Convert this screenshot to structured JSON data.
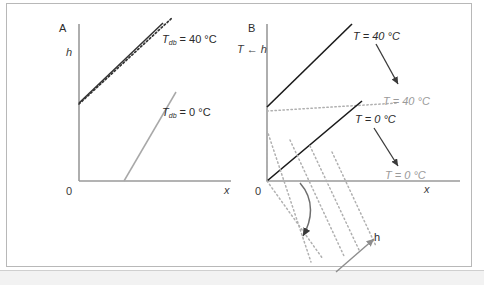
{
  "figure": {
    "background_color": "#ffffff",
    "border_color": "#b8b8b8",
    "bottom_strip_color": "#f2f2f2"
  },
  "colors": {
    "dark_line": "#333333",
    "black_line": "#1a1a1a",
    "gray_line": "#a8a8a8",
    "gray_dotted": "#b0b0b0",
    "axis": "#9a9a9a",
    "text_dark": "#2b2b2b",
    "text_gray": "#9a9a9a"
  },
  "panel_a": {
    "letter": "A",
    "y_axis_label": "h",
    "x_axis_label": "x",
    "origin_label": "0",
    "annotations": [
      {
        "id": "tdb40",
        "symbol": "T",
        "subscript": "db",
        "equals": " = 40 °C",
        "full_text": "T_db = 40 °C",
        "color": "#2b2b2b",
        "style": "dark"
      },
      {
        "id": "tdb0",
        "symbol": "T",
        "subscript": "db",
        "equals": " = 0 °C",
        "full_text": "T_db = 0 °C",
        "color": "#2b2b2b",
        "style": "dark"
      }
    ],
    "curves": [
      {
        "id": "solid-dark-40",
        "kind": "solid",
        "color": "#333333"
      },
      {
        "id": "dotted-dark-40",
        "kind": "dotted",
        "color": "#333333"
      },
      {
        "id": "solid-gray-0",
        "kind": "solid",
        "color": "#a8a8a8"
      }
    ]
  },
  "panel_b": {
    "letter": "B",
    "y_axis_label": "T",
    "y_axis_arrow": "←",
    "y_axis_label_2": "h",
    "x_axis_label": "x",
    "origin_label": "0",
    "h_axis_label": "h",
    "annotations": [
      {
        "id": "t40-dark",
        "full_text": "T = 40 °C",
        "style": "dark"
      },
      {
        "id": "t40-gray",
        "full_text": "T = 40 °C",
        "style": "gray"
      },
      {
        "id": "t0-dark",
        "full_text": "T = 0 °C",
        "style": "dark"
      },
      {
        "id": "t0-gray",
        "full_text": "T = 0 °C",
        "style": "gray"
      }
    ],
    "curves": [
      {
        "id": "steep-black-40",
        "kind": "solid",
        "color": "#1a1a1a"
      },
      {
        "id": "flat-gray-dotted-40",
        "kind": "dotted",
        "color": "#b0b0b0"
      },
      {
        "id": "shallow-black-0",
        "kind": "solid",
        "color": "#1a1a1a"
      },
      {
        "id": "x-axis-gray-0",
        "kind": "solid",
        "color": "#9a9a9a"
      },
      {
        "id": "dotted-fan",
        "kind": "dotted",
        "color": "#b0b0b0",
        "count": 5
      }
    ]
  }
}
